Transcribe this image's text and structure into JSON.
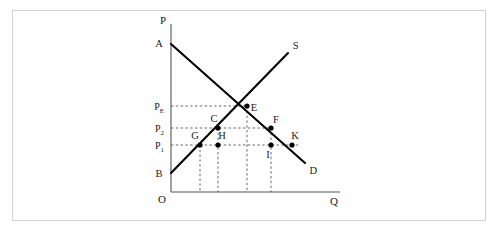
{
  "figure": {
    "background_color": "#ffffff",
    "frame_color": "#d2d2d2",
    "curve_color": "#000000",
    "axis_color": "#555555",
    "guide_color": "#555555"
  },
  "axes": {
    "vertical_axis_label": "P",
    "horizontal_axis_label": "Q",
    "origin_label": "O"
  },
  "curves": [
    {
      "name": "demand",
      "label": "D",
      "start_label": "A",
      "x1": 171,
      "y1": 44,
      "x2": 305,
      "y2": 163
    },
    {
      "name": "supply",
      "label": "S",
      "start_label": "B",
      "x1": 171,
      "y1": 173,
      "x2": 288,
      "y2": 53
    }
  ],
  "price_levels": [
    {
      "name": "equilibrium-price",
      "label": "P",
      "subscript": "E",
      "y": 106
    },
    {
      "name": "price-two",
      "label": "P",
      "subscript": "2",
      "y": 128
    },
    {
      "name": "price-one",
      "label": "P",
      "subscript": "1",
      "y": 145
    }
  ],
  "points": [
    {
      "name": "point-a",
      "label": "A",
      "x": 171,
      "y": 44,
      "dot": false,
      "label_dx": -12,
      "label_dy": 3
    },
    {
      "name": "point-b",
      "label": "B",
      "x": 171,
      "y": 173,
      "dot": false,
      "label_dx": -12,
      "label_dy": 4
    },
    {
      "name": "point-e",
      "label": "E",
      "x": 247,
      "y": 106,
      "dot": true,
      "label_dx": 7,
      "label_dy": 5
    },
    {
      "name": "point-c",
      "label": "C",
      "x": 218,
      "y": 128,
      "dot": true,
      "label_dx": -4,
      "label_dy": -6
    },
    {
      "name": "point-f",
      "label": "F",
      "x": 271,
      "y": 128,
      "dot": true,
      "label_dx": 5,
      "label_dy": -5
    },
    {
      "name": "point-g",
      "label": "G",
      "x": 200,
      "y": 145,
      "dot": true,
      "label_dx": -5,
      "label_dy": -6
    },
    {
      "name": "point-h",
      "label": "H",
      "x": 218,
      "y": 145,
      "dot": true,
      "label_dx": 4,
      "label_dy": -6
    },
    {
      "name": "point-i",
      "label": "I",
      "x": 271,
      "y": 145,
      "dot": true,
      "label_dx": -3,
      "label_dy": 13
    },
    {
      "name": "point-k",
      "label": "K",
      "x": 292,
      "y": 145,
      "dot": true,
      "label_dx": 3,
      "label_dy": -6
    }
  ],
  "drop_lines": [
    {
      "name": "drop-from-g",
      "x": 200,
      "y_top": 145
    },
    {
      "name": "drop-from-c",
      "x": 218,
      "y_top": 128
    },
    {
      "name": "drop-from-e",
      "x": 247,
      "y_top": 106
    },
    {
      "name": "drop-from-f",
      "x": 271,
      "y_top": 128
    }
  ],
  "chart_data": {
    "type": "line",
    "xlabel": "Q",
    "ylabel": "P",
    "grid": false,
    "legend": "none",
    "axis_origin_label": "O",
    "series": [
      {
        "name": "Demand",
        "label": "D",
        "endpoints": [
          {
            "point": "A",
            "x": 0,
            "y": 108
          },
          {
            "point": "D",
            "x": 134,
            "y": 0
          }
        ],
        "marked_points": [
          {
            "label": "E",
            "x": 76,
            "y": 61,
            "price_level": "P_E"
          },
          {
            "label": "F",
            "x": 100,
            "y": 41,
            "price_level": "P_2"
          },
          {
            "label": "K",
            "x": 121,
            "y": 25,
            "price_level": "P_1"
          }
        ]
      },
      {
        "name": "Supply",
        "label": "S",
        "endpoints": [
          {
            "point": "B",
            "x": 0,
            "y": 0
          },
          {
            "point": "S",
            "x": 117,
            "y": 120
          }
        ],
        "marked_points": [
          {
            "label": "G",
            "x": 29,
            "y": 25,
            "price_level": "P_1"
          },
          {
            "label": "C",
            "x": 47,
            "y": 43,
            "price_level": "P_2"
          },
          {
            "label": "E",
            "x": 76,
            "y": 61,
            "price_level": "P_E"
          }
        ]
      }
    ],
    "interior_points": [
      {
        "label": "H",
        "x": 47,
        "y": 25,
        "price_level": "P_1"
      },
      {
        "label": "I",
        "x": 100,
        "y": 25,
        "price_level": "P_1"
      }
    ],
    "price_levels": [
      {
        "label": "P_E",
        "value": 61
      },
      {
        "label": "P_2",
        "value": 43
      },
      {
        "label": "P_1",
        "value": 25
      }
    ],
    "quantity_drop_lines": [
      {
        "from_point": "G",
        "x": 29
      },
      {
        "from_point": "C/H",
        "x": 47
      },
      {
        "from_point": "E",
        "x": 76
      },
      {
        "from_point": "F/I",
        "x": 100
      }
    ]
  }
}
